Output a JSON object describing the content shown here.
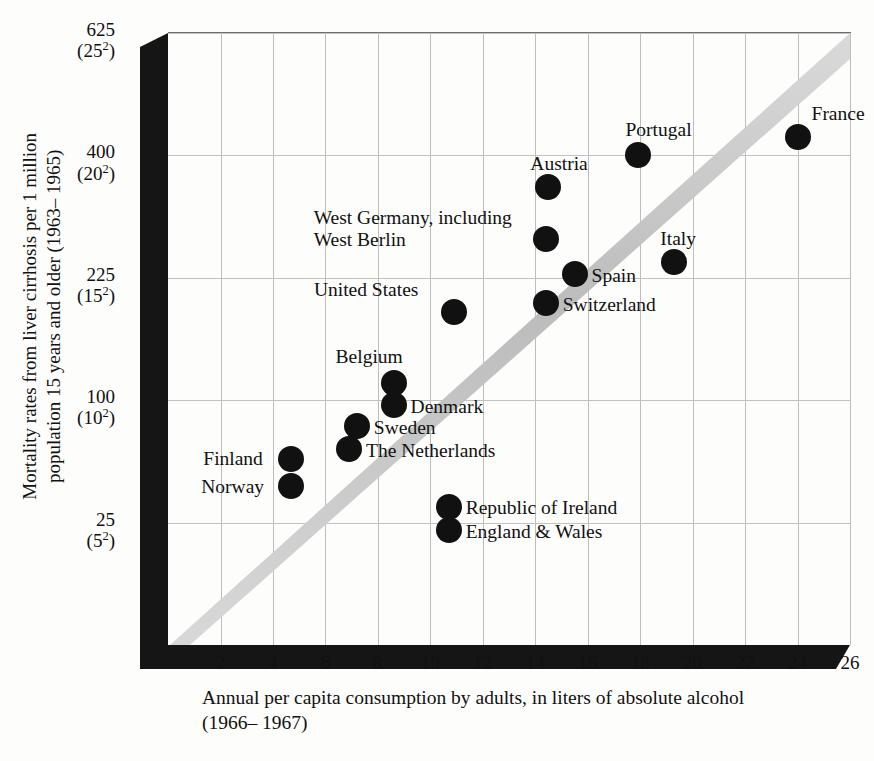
{
  "chart_data": {
    "type": "scatter",
    "title": "",
    "xlabel": "Annual per capita consumption by adults, in liters of absolute alcohol",
    "xlabel_line2": "(1966– 1967)",
    "ylabel": "Mortality rates from liver cirrhosis per 1 million",
    "ylabel_line2": "population 15 years and older (1963– 1965)",
    "xlim": [
      0,
      26
    ],
    "ylim": [
      0,
      625
    ],
    "yscale": "sqrt",
    "grid": true,
    "legend": false,
    "xticks": [
      2,
      4,
      6,
      8,
      10,
      12,
      14,
      16,
      18,
      20,
      22,
      24,
      26
    ],
    "yticks": [
      {
        "value": 625,
        "label": "625",
        "sub": "(25",
        "sup": "2",
        "subend": ")"
      },
      {
        "value": 400,
        "label": "400",
        "sub": "(20",
        "sup": "2",
        "subend": ")"
      },
      {
        "value": 225,
        "label": "225",
        "sub": "(15",
        "sup": "2",
        "subend": ")"
      },
      {
        "value": 100,
        "label": "100",
        "sub": "(10",
        "sup": "2",
        "subend": ")"
      },
      {
        "value": 25,
        "label": "25",
        "sub": "(5",
        "sup": "2",
        "subend": ")"
      }
    ],
    "annotations": [
      {
        "text": "trend band",
        "type": "diagonal-gray-band",
        "from": [
          0,
          0
        ],
        "to": [
          26,
          625
        ]
      }
    ],
    "points": [
      {
        "name": "France",
        "x": 24.0,
        "y": 430,
        "label_pos": "above"
      },
      {
        "name": "Portugal",
        "x": 17.9,
        "y": 400,
        "label_pos": "above"
      },
      {
        "name": "Austria",
        "x": 14.5,
        "y": 350,
        "label_pos": "above"
      },
      {
        "name": "West Germany, including West Berlin",
        "x": 14.4,
        "y": 275,
        "label_pos": "left"
      },
      {
        "name": "Italy",
        "x": 19.3,
        "y": 245,
        "label_pos": "above"
      },
      {
        "name": "Spain",
        "x": 15.5,
        "y": 230,
        "label_pos": "right"
      },
      {
        "name": "Switzerland",
        "x": 14.4,
        "y": 195,
        "label_pos": "right"
      },
      {
        "name": "United States",
        "x": 10.9,
        "y": 185,
        "label_pos": "above"
      },
      {
        "name": "Belgium",
        "x": 8.6,
        "y": 115,
        "label_pos": "above"
      },
      {
        "name": "Denmark",
        "x": 8.6,
        "y": 96,
        "label_pos": "right"
      },
      {
        "name": "Sweden",
        "x": 7.2,
        "y": 80,
        "label_pos": "right"
      },
      {
        "name": "The Netherlands",
        "x": 6.9,
        "y": 64,
        "label_pos": "right"
      },
      {
        "name": "Finland",
        "x": 4.7,
        "y": 58,
        "label_pos": "left"
      },
      {
        "name": "Norway",
        "x": 4.7,
        "y": 42,
        "label_pos": "left"
      },
      {
        "name": "Republic of Ireland",
        "x": 10.7,
        "y": 32,
        "label_pos": "right"
      },
      {
        "name": "England & Wales",
        "x": 10.7,
        "y": 22,
        "label_pos": "right"
      }
    ]
  },
  "colors": {
    "point": "#111111",
    "axis": "#151515",
    "grid": "#bdbdbd",
    "band": "#c9c9c9",
    "background": "#fdfdfb"
  },
  "labels": {
    "france": "France",
    "portugal": "Portugal",
    "austria": "Austria",
    "west_germany_1": "West Germany, including",
    "west_germany_2": "West Berlin",
    "italy": "Italy",
    "spain": "Spain",
    "switzerland": "Switzerland",
    "united_states": "United States",
    "belgium": "Belgium",
    "denmark": "Denmark",
    "sweden": "Sweden",
    "netherlands": "The Netherlands",
    "finland": "Finland",
    "norway": "Norway",
    "ireland": "Republic of Ireland",
    "england_wales": "England & Wales"
  },
  "axis_text": {
    "y_line1": "Mortality rates from liver cirrhosis per 1 million",
    "y_line2": "population 15 years and older (1963– 1965)",
    "x_line1": "Annual per capita consumption by adults, in liters of absolute alcohol",
    "x_line2": "(1966– 1967)"
  }
}
